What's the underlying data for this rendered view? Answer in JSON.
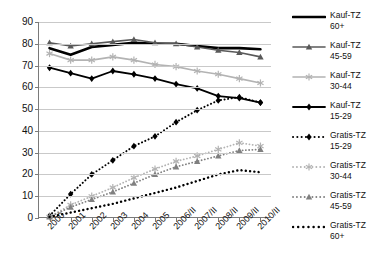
{
  "chart_data": {
    "type": "line",
    "title": "",
    "xlabel": "",
    "ylabel": "",
    "ylim": [
      0,
      90
    ],
    "ytick_step": 10,
    "grid": true,
    "legend_position": "right",
    "yticks": [
      "0",
      "10",
      "20",
      "30",
      "40",
      "50",
      "60",
      "70",
      "80",
      "90"
    ],
    "categories": [
      "2000",
      "2001",
      "2002",
      "2003",
      "2004",
      "2005",
      "2006/II",
      "2007/II",
      "2008/II",
      "2009/II",
      "2010/II"
    ],
    "series": [
      {
        "name": "Kauf-TZ 60+",
        "label": "Kauf-TZ\n60+",
        "color": "#000000",
        "style": "solid",
        "marker": "none",
        "width": 2.6,
        "values": [
          78.0,
          75.0,
          78.5,
          79.5,
          80.5,
          80.0,
          80.0,
          79.0,
          78.0,
          78.0,
          77.5
        ]
      },
      {
        "name": "Kauf-TZ 45-59",
        "label": "Kauf-TZ\n45-59",
        "color": "#595959",
        "style": "solid",
        "marker": "triangle",
        "width": 1.6,
        "values": [
          80.5,
          79.0,
          80.0,
          81.0,
          82.0,
          80.5,
          80.0,
          78.5,
          77.0,
          76.0,
          74.0
        ]
      },
      {
        "name": "Kauf-TZ 30-44",
        "label": "Kauf-TZ\n30-44",
        "color": "#b3b3b3",
        "style": "solid",
        "marker": "asterisk",
        "width": 1.6,
        "values": [
          75.5,
          72.5,
          72.5,
          74.0,
          72.5,
          70.5,
          69.5,
          67.5,
          66.0,
          64.0,
          62.0
        ]
      },
      {
        "name": "Kauf-TZ 15-29",
        "label": "Kauf-TZ\n15-29",
        "color": "#000000",
        "style": "solid",
        "marker": "diamond",
        "width": 1.8,
        "values": [
          69.0,
          66.5,
          64.0,
          67.5,
          66.0,
          64.0,
          61.5,
          59.5,
          56.0,
          55.0,
          53.0
        ]
      },
      {
        "name": "Gratis-TZ 15-29",
        "label": "Gratis-TZ\n15-29",
        "color": "#000000",
        "style": "dotted",
        "marker": "diamond",
        "width": 2.0,
        "values": [
          1.0,
          11.0,
          20.0,
          26.5,
          33.0,
          37.5,
          44.0,
          49.5,
          54.0,
          55.5,
          53.0
        ]
      },
      {
        "name": "Gratis-TZ 30-44",
        "label": "Gratis-TZ\n30-44",
        "color": "#b3b3b3",
        "style": "dotted",
        "marker": "asterisk",
        "width": 1.8,
        "values": [
          0.5,
          6.0,
          10.0,
          14.0,
          18.5,
          22.5,
          26.0,
          28.5,
          31.5,
          34.5,
          33.0
        ]
      },
      {
        "name": "Gratis-TZ 45-59",
        "label": "Gratis-TZ\n45-59",
        "color": "#808080",
        "style": "dotted",
        "marker": "triangle",
        "width": 1.8,
        "values": [
          0.5,
          5.0,
          8.5,
          12.0,
          16.0,
          20.0,
          23.5,
          26.0,
          28.5,
          31.0,
          31.5
        ]
      },
      {
        "name": "Gratis-TZ 60+",
        "label": "Gratis-TZ\n60+",
        "color": "#000000",
        "style": "dotted",
        "marker": "none",
        "width": 2.4,
        "values": [
          0.5,
          2.5,
          4.5,
          6.5,
          9.0,
          11.5,
          14.0,
          17.0,
          20.0,
          22.0,
          21.0
        ]
      }
    ]
  }
}
